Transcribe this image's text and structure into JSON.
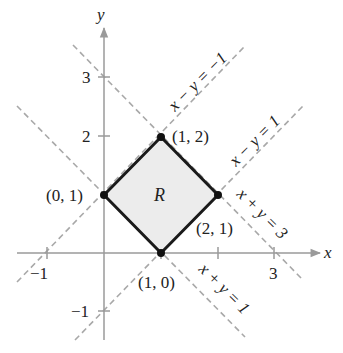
{
  "diagram": {
    "type": "coordinate-plane-region",
    "axes": {
      "x_label": "x",
      "y_label": "y",
      "x_ticks": [
        {
          "value": -1,
          "label": "−1"
        },
        {
          "value": 1,
          "label": ""
        },
        {
          "value": 2,
          "label": ""
        },
        {
          "value": 3,
          "label": "3"
        }
      ],
      "y_ticks": [
        {
          "value": 3,
          "label": "3"
        },
        {
          "value": 2,
          "label": "2"
        },
        {
          "value": -1,
          "label": "−1"
        }
      ]
    },
    "region": {
      "label": "R",
      "fill": "#ececec",
      "stroke": "#1a1a1a",
      "vertices": [
        {
          "x": 0,
          "y": 1,
          "label": "(0, 1)"
        },
        {
          "x": 1,
          "y": 2,
          "label": "(1, 2)"
        },
        {
          "x": 2,
          "y": 1,
          "label": "(2, 1)"
        },
        {
          "x": 1,
          "y": 0,
          "label": "(1, 0)"
        }
      ]
    },
    "lines": [
      {
        "equation": "x − y = −1",
        "style": "dashed"
      },
      {
        "equation": "x − y = 1",
        "style": "dashed"
      },
      {
        "equation": "x + y = 3",
        "style": "dashed"
      },
      {
        "equation": "x + y = 1",
        "style": "dashed"
      }
    ],
    "colors": {
      "axis": "#9a9a9a",
      "dashed": "#a8a8a8",
      "region_fill": "#ececec",
      "region_stroke": "#1a1a1a"
    }
  }
}
